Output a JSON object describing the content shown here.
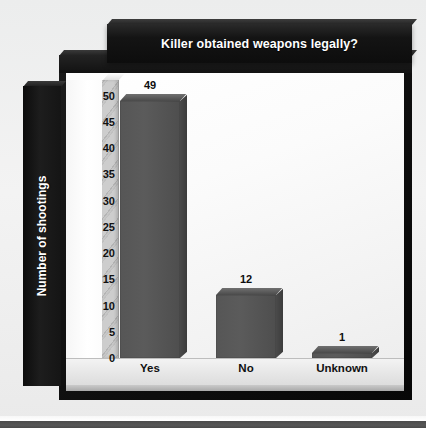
{
  "chart_data": {
    "type": "bar",
    "title": "Killer obtained weapons legally?",
    "xlabel": "",
    "ylabel": "Number of shootings",
    "categories": [
      "Yes",
      "No",
      "Unknown"
    ],
    "values": [
      49,
      12,
      1
    ],
    "value_labels": [
      "49",
      "12",
      "1"
    ],
    "ytick_labels": [
      "50",
      "45",
      "40",
      "35",
      "30",
      "25",
      "20",
      "15",
      "10",
      "5",
      "0"
    ],
    "ytick_values": [
      50,
      45,
      40,
      35,
      30,
      25,
      20,
      15,
      10,
      5,
      0
    ],
    "ylim": [
      0,
      53
    ],
    "grid": false,
    "legend": false,
    "style": "3d",
    "bar_color": "#565656",
    "title_bar_color": "#141414",
    "title_text_color": "#ffffff",
    "plot_background": "#fbfbfb",
    "page_background": "#efefef"
  }
}
